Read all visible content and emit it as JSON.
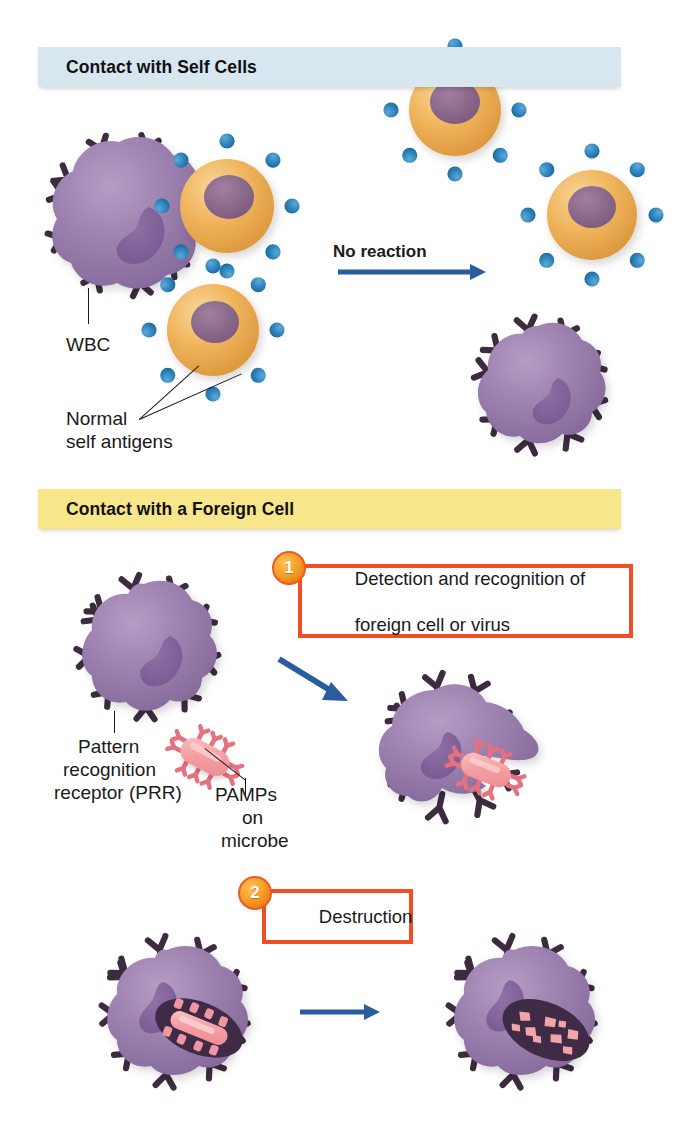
{
  "figure": {
    "background": "#ffffff"
  },
  "sections": [
    {
      "id": "self",
      "header": "Contact with Self Cells",
      "header_color": "#d8e6ef"
    },
    {
      "id": "foreign",
      "header": "Contact with a Foreign Cell",
      "header_color": "#f7e68a"
    }
  ],
  "labels": {
    "wbc": "WBC",
    "normal_self_antigens_line1": "Normal",
    "normal_self_antigens_line2": "self antigens",
    "no_reaction": "No reaction",
    "prr_line1": "Pattern",
    "prr_line2": "recognition",
    "prr_line3": "receptor (PRR)",
    "pamps_line1": "PAMPs",
    "pamps_line2": "on",
    "pamps_line3": "microbe"
  },
  "steps": [
    {
      "number": "1",
      "text_line1": "Detection and recognition of",
      "text_line2": "foreign cell or virus",
      "border_color": "#f04e23",
      "badge_color": "#f6a12a"
    },
    {
      "number": "2",
      "text_line1": "Destruction",
      "text_line2": "",
      "border_color": "#f04e23",
      "badge_color": "#f6a12a"
    }
  ],
  "colors": {
    "wbc_body": "#9b7fae",
    "wbc_nucleus": "#7f5f96",
    "wbc_receptor": "#3d2b3f",
    "self_cell_body": "#f0b45c",
    "self_cell_nucleus": "#8d6a8d",
    "self_antigen": "#2f86bf",
    "microbe_body": "#f5a0a4",
    "microbe_pamp": "#e5717f",
    "vacuole": "#3f2b45",
    "arrow_blue": "#2a5d9e",
    "band_self": "#d8e6ef",
    "band_foreign": "#f7e68a",
    "callout_border": "#f04e23",
    "text": "#1a1a1a"
  },
  "arrows": [
    {
      "name": "no-reaction-arrow",
      "from": [
        338,
        272
      ],
      "to": [
        482,
        272
      ],
      "color": "#2a5d9e"
    },
    {
      "name": "detection-arrow",
      "from": [
        281,
        661
      ],
      "to": [
        345,
        700
      ],
      "color": "#2a5d9e"
    },
    {
      "name": "destruction-arrow",
      "from": [
        300,
        1012
      ],
      "to": [
        378,
        1012
      ],
      "color": "#2a5d9e"
    }
  ]
}
